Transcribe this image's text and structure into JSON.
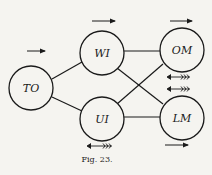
{
  "diagram": {
    "caption": "Fig. 23.",
    "nodes": [
      {
        "id": "TO",
        "label": "TO"
      },
      {
        "id": "WI",
        "label": "WI"
      },
      {
        "id": "UI",
        "label": "UI"
      },
      {
        "id": "OM",
        "label": "OM"
      },
      {
        "id": "LM",
        "label": "LM"
      }
    ],
    "edges": [
      [
        "TO",
        "WI"
      ],
      [
        "TO",
        "UI"
      ],
      [
        "WI",
        "OM"
      ],
      [
        "WI",
        "LM"
      ],
      [
        "UI",
        "OM"
      ],
      [
        "UI",
        "LM"
      ]
    ],
    "arrows": [
      {
        "near": "TO",
        "position": "above",
        "direction": "right",
        "style": "plain"
      },
      {
        "near": "WI",
        "position": "above",
        "direction": "right",
        "style": "plain"
      },
      {
        "near": "OM",
        "position": "above",
        "direction": "right",
        "style": "plain"
      },
      {
        "near": "OM",
        "position": "below",
        "direction": "left",
        "style": "feathered"
      },
      {
        "near": "LM",
        "position": "above",
        "direction": "left",
        "style": "feathered"
      },
      {
        "near": "LM",
        "position": "below",
        "direction": "right",
        "style": "plain"
      },
      {
        "near": "UI",
        "position": "below",
        "direction": "left",
        "style": "feathered"
      }
    ],
    "colors": {
      "ink": "#1a1a1a",
      "paper": "#f5f4f0"
    }
  }
}
